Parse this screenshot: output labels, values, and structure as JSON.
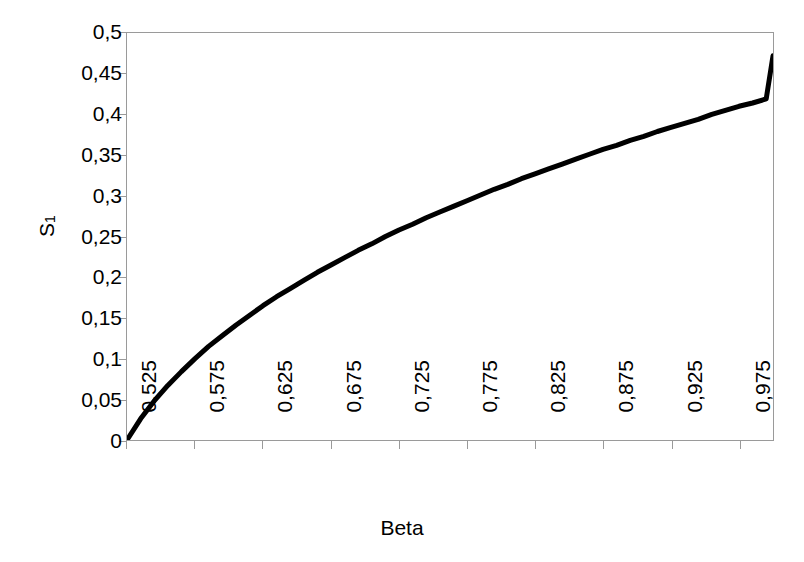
{
  "chart_data": {
    "type": "line",
    "title": "",
    "xlabel": "Beta",
    "ylabel": "S1",
    "ylabel_base": "S",
    "ylabel_sub": "1",
    "xlim": [
      0.525,
      1.0
    ],
    "ylim": [
      0,
      0.5
    ],
    "grid": false,
    "legend": null,
    "line_color": "#000000",
    "frame_color": "#9a9a9a",
    "background": "#ffffff",
    "x_tick_labels": [
      "0,525",
      "0,575",
      "0,625",
      "0,675",
      "0,725",
      "0,775",
      "0,825",
      "0,875",
      "0,925",
      "0,975"
    ],
    "x_tick_values": [
      0.525,
      0.575,
      0.625,
      0.675,
      0.725,
      0.775,
      0.825,
      0.875,
      0.925,
      0.975
    ],
    "y_tick_labels": [
      "0,5",
      "0,45",
      "0,4",
      "0,35",
      "0,3",
      "0,25",
      "0,2",
      "0,15",
      "0,1",
      "0,05",
      "0"
    ],
    "y_tick_values": [
      0.5,
      0.45,
      0.4,
      0.35,
      0.3,
      0.25,
      0.2,
      0.15,
      0.1,
      0.05,
      0
    ],
    "series": [
      {
        "name": "S1",
        "x": [
          0.525,
          0.535,
          0.545,
          0.555,
          0.565,
          0.575,
          0.585,
          0.595,
          0.605,
          0.615,
          0.625,
          0.635,
          0.645,
          0.655,
          0.665,
          0.675,
          0.685,
          0.695,
          0.705,
          0.715,
          0.725,
          0.735,
          0.745,
          0.755,
          0.765,
          0.775,
          0.785,
          0.795,
          0.805,
          0.815,
          0.825,
          0.835,
          0.845,
          0.855,
          0.865,
          0.875,
          0.885,
          0.895,
          0.905,
          0.915,
          0.925,
          0.935,
          0.945,
          0.955,
          0.965,
          0.975,
          0.985,
          0.995,
          1.0
        ],
        "y": [
          0.0,
          0.026,
          0.048,
          0.067,
          0.084,
          0.1,
          0.115,
          0.128,
          0.141,
          0.153,
          0.165,
          0.176,
          0.186,
          0.196,
          0.206,
          0.215,
          0.224,
          0.233,
          0.241,
          0.25,
          0.258,
          0.265,
          0.273,
          0.28,
          0.287,
          0.294,
          0.301,
          0.308,
          0.314,
          0.321,
          0.327,
          0.333,
          0.339,
          0.345,
          0.351,
          0.357,
          0.362,
          0.368,
          0.373,
          0.379,
          0.384,
          0.389,
          0.394,
          0.4,
          0.405,
          0.41,
          0.414,
          0.419,
          0.472
        ]
      }
    ]
  }
}
